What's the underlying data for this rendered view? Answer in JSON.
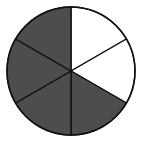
{
  "diagram": {
    "type": "fraction-circle",
    "total_parts": 6,
    "shaded_parts": 4,
    "unshaded_parts": 2,
    "center": [
      71,
      71
    ],
    "radius": 64,
    "colors": {
      "shaded": "#4d4d4d",
      "unshaded": "#ffffff",
      "stroke": "#111111",
      "background": "#ffffff"
    },
    "sectors": [
      {
        "index": 0,
        "start_deg": 0,
        "end_deg": 60,
        "shaded": false
      },
      {
        "index": 1,
        "start_deg": 60,
        "end_deg": 120,
        "shaded": false
      },
      {
        "index": 2,
        "start_deg": 120,
        "end_deg": 180,
        "shaded": true
      },
      {
        "index": 3,
        "start_deg": 180,
        "end_deg": 240,
        "shaded": true
      },
      {
        "index": 4,
        "start_deg": 240,
        "end_deg": 300,
        "shaded": true
      },
      {
        "index": 5,
        "start_deg": 300,
        "end_deg": 360,
        "shaded": true
      }
    ]
  }
}
